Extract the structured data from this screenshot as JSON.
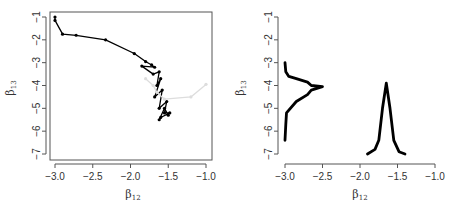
{
  "chart_data": [
    {
      "type": "line",
      "title": "",
      "xlabel": "β12",
      "ylabel": "β13",
      "xlim": [
        -3.0,
        -1.0
      ],
      "ylim": [
        -7,
        -1
      ],
      "xticks": [
        "-3.0",
        "-2.5",
        "-2.0",
        "-1.5",
        "-1.0"
      ],
      "yticks": [
        "-1",
        "-2",
        "-3",
        "-4",
        "-5",
        "-6",
        "-7"
      ],
      "grid": false,
      "series": [
        {
          "name": "trace-black",
          "color": "#000000",
          "x": [
            -3.0,
            -3.0,
            -2.9,
            -2.72,
            -2.33,
            -1.95,
            -1.8,
            -1.72,
            -1.68,
            -1.85,
            -1.7,
            -1.62,
            -1.65,
            -1.6,
            -1.68,
            -1.58,
            -1.62,
            -1.52,
            -1.55,
            -1.48,
            -1.6,
            -1.62,
            -1.55,
            -1.5
          ],
          "y": [
            -1.0,
            -1.15,
            -1.75,
            -1.8,
            -2.0,
            -2.6,
            -2.95,
            -3.1,
            -3.2,
            -3.15,
            -3.5,
            -3.4,
            -4.0,
            -3.7,
            -4.5,
            -4.2,
            -5.0,
            -4.7,
            -5.2,
            -5.2,
            -5.4,
            -5.5,
            -5.0,
            -5.3
          ]
        },
        {
          "name": "trace-gray",
          "color": "#dddddd",
          "x": [
            -1.8,
            -1.7,
            -1.65,
            -1.55,
            -1.2,
            -1.0
          ],
          "y": [
            -3.7,
            -4.0,
            -4.3,
            -4.6,
            -4.5,
            -3.95
          ]
        }
      ]
    },
    {
      "type": "line",
      "title": "",
      "xlabel": "β12",
      "ylabel": "β13",
      "xlim": [
        -3.0,
        -1.0
      ],
      "ylim": [
        -7,
        -1
      ],
      "xticks": [
        "-3.0",
        "-2.5",
        "-2.0",
        "-1.5",
        "-1.0"
      ],
      "yticks": [
        "-1",
        "-2",
        "-3",
        "-4",
        "-5",
        "-6",
        "-7"
      ],
      "grid": false,
      "series": [
        {
          "name": "marginal-density-beta13",
          "color": "#000000",
          "x": [
            -3.0,
            -2.99,
            -2.95,
            -2.85,
            -2.7,
            -2.65,
            -2.5,
            -2.65,
            -2.7,
            -2.85,
            -2.98,
            -2.99,
            -3.0
          ],
          "y": [
            -3.0,
            -3.4,
            -3.6,
            -3.7,
            -3.85,
            -4.0,
            -4.05,
            -4.2,
            -4.4,
            -4.7,
            -5.2,
            -5.7,
            -6.4
          ]
        },
        {
          "name": "marginal-density-beta12",
          "color": "#000000",
          "x": [
            -1.9,
            -1.8,
            -1.75,
            -1.7,
            -1.65,
            -1.6,
            -1.55,
            -1.48,
            -1.4
          ],
          "y": [
            -7.0,
            -6.8,
            -6.4,
            -5.0,
            -3.9,
            -5.0,
            -6.4,
            -6.9,
            -7.0
          ]
        }
      ]
    }
  ]
}
